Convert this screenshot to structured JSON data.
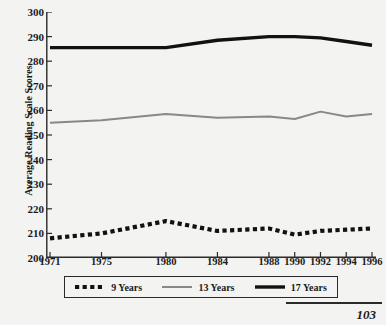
{
  "figure": {
    "page_number": "103",
    "background_color": "#f3f3f1"
  },
  "axes": {
    "y_title": "Average Reading Scale Scores",
    "y_ticks": [
      "300",
      "290",
      "280",
      "270",
      "260",
      "250",
      "240",
      "230",
      "220",
      "210",
      "200"
    ],
    "x_ticks": [
      "1971",
      "1975",
      "1980",
      "1984",
      "1988",
      "1990",
      "1992",
      "1994",
      "1996"
    ]
  },
  "legend": {
    "items": [
      {
        "label": "9 Years",
        "style": "dotted",
        "color": "#111111"
      },
      {
        "label": "13 Years",
        "style": "solid-thin",
        "color": "#888888"
      },
      {
        "label": "17 Years",
        "style": "solid-thick",
        "color": "#111111"
      }
    ]
  },
  "chart_data": {
    "type": "line",
    "title": "",
    "xlabel": "",
    "ylabel": "Average Reading Scale Scores",
    "x": [
      1971,
      1975,
      1980,
      1984,
      1988,
      1990,
      1992,
      1994,
      1996
    ],
    "categories": [
      "1971",
      "1975",
      "1980",
      "1984",
      "1988",
      "1990",
      "1992",
      "1994",
      "1996"
    ],
    "ylim": [
      200,
      300
    ],
    "xlim": [
      1971,
      1996
    ],
    "ytick_step": 10,
    "grid": false,
    "legend_position": "bottom",
    "series": [
      {
        "name": "9 Years",
        "color": "#111111",
        "style": "dotted",
        "values": [
          208,
          210,
          215,
          211,
          212,
          209.5,
          211,
          211.5,
          212
        ]
      },
      {
        "name": "13 Years",
        "color": "#888888",
        "style": "solid-thin",
        "values": [
          255,
          256,
          258.5,
          257,
          257.5,
          256.5,
          259.5,
          257.5,
          258.5
        ]
      },
      {
        "name": "17 Years",
        "color": "#111111",
        "style": "solid-thick",
        "values": [
          285.5,
          285.5,
          285.5,
          288.5,
          290,
          290,
          289.5,
          288,
          286.5
        ]
      }
    ]
  }
}
